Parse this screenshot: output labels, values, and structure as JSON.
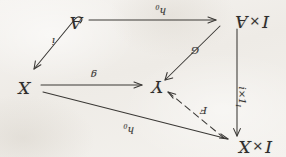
{
  "figure": {
    "kind": "commutative-diagram",
    "orientation": "rotated-180",
    "background_color": "#f1eeea",
    "ink_color": "#343230",
    "nodes": [
      {
        "id": "IxX",
        "label_left": "I",
        "operator": "×",
        "label_right": "X",
        "full": "I × X",
        "position": "top-left"
      },
      {
        "id": "Y",
        "label_left": "",
        "operator": "",
        "label_right": "Y",
        "full": "Y",
        "position": "center"
      },
      {
        "id": "X",
        "label_left": "",
        "operator": "",
        "label_right": "X",
        "full": "X",
        "position": "right"
      },
      {
        "id": "IxA",
        "label_left": "I",
        "operator": "×",
        "label_right": "A",
        "full": "I × A",
        "position": "bottom-left"
      },
      {
        "id": "A",
        "label_left": "",
        "operator": "",
        "label_right": "A",
        "full": "A",
        "position": "bottom-right"
      }
    ],
    "edges": [
      {
        "id": "h0-top",
        "label": "h",
        "subscript": "0",
        "from": "X",
        "to": "IxX",
        "style": "solid"
      },
      {
        "id": "F-diag",
        "label": "F",
        "subscript": "",
        "from": "IxX",
        "to": "Y",
        "style": "dashed"
      },
      {
        "id": "ix1",
        "label": "i×1",
        "subscript": "I",
        "from": "IxA",
        "to": "IxX",
        "style": "solid"
      },
      {
        "id": "G-diag",
        "label": "G",
        "subscript": "",
        "from": "IxA",
        "to": "Y",
        "style": "solid"
      },
      {
        "id": "g-right",
        "label": "g",
        "subscript": "",
        "from": "X",
        "to": "Y",
        "style": "solid"
      },
      {
        "id": "h0-bottom",
        "label": "h",
        "subscript": "0",
        "from": "A",
        "to": "IxA",
        "style": "solid"
      },
      {
        "id": "i-right",
        "label": "i",
        "subscript": "",
        "from": "A",
        "to": "X",
        "style": "solid"
      }
    ]
  }
}
